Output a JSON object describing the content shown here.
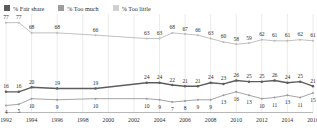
{
  "legend": {
    "items": [
      {
        "label": "% Fair share",
        "color": "#5b5b5b",
        "icon": "square-swatch"
      },
      {
        "label": "% Too much",
        "color": "#8f8f8f",
        "icon": "square-swatch"
      },
      {
        "label": "% Too little",
        "color": "#c4c4c4",
        "icon": "square-swatch"
      }
    ]
  },
  "chart_data": {
    "type": "line",
    "title": "",
    "subtitle": "",
    "xlabel": "",
    "ylabel": "",
    "grid": true,
    "grid_orientation": "vertical",
    "legend_position": "top-left",
    "ylim": [
      0,
      100
    ],
    "xlim": [
      1992,
      2016
    ],
    "x": [
      1992,
      1993,
      1994,
      1995,
      1996,
      1997,
      1998,
      1999,
      2000,
      2001,
      2002,
      2003,
      2004,
      2005,
      2006,
      2007,
      2008,
      2009,
      2010,
      2011,
      2012,
      2013,
      2014,
      2015,
      2016
    ],
    "tick_labels": [
      "1992",
      "1994",
      "1996",
      "1998",
      "2000",
      "2002",
      "2004",
      "2006",
      "2008",
      "2010",
      "2012",
      "2014",
      "2016"
    ],
    "tick_values": [
      1992,
      1994,
      1996,
      1998,
      2000,
      2002,
      2004,
      2006,
      2008,
      2010,
      2012,
      2014,
      2016
    ],
    "series": [
      {
        "name": "% Fair share",
        "color": "#b9b9b9",
        "x": [
          1992,
          1993,
          1994,
          1996,
          1999,
          2003,
          2004,
          2005,
          2006,
          2007,
          2008,
          2009,
          2010,
          2011,
          2012,
          2013,
          2014,
          2015,
          2016
        ],
        "values": [
          77,
          77,
          68,
          68,
          66,
          63,
          63,
          68,
          67,
          66,
          63,
          60,
          58,
          59,
          62,
          61,
          61,
          62,
          61
        ]
      },
      {
        "name": "% Too much",
        "color": "#5d5d5d",
        "x": [
          1992,
          1993,
          1994,
          1996,
          1999,
          2003,
          2004,
          2005,
          2006,
          2007,
          2008,
          2009,
          2010,
          2011,
          2012,
          2013,
          2014,
          2015,
          2016
        ],
        "values": [
          16,
          16,
          20,
          19,
          19,
          24,
          24,
          22,
          21,
          21,
          24,
          23,
          26,
          25,
          25,
          26,
          24,
          25,
          21
        ]
      },
      {
        "name": "% Too little",
        "color": "#9a9a9a",
        "x": [
          1992,
          1993,
          1994,
          1996,
          1999,
          2003,
          2004,
          2005,
          2006,
          2007,
          2008,
          2009,
          2010,
          2011,
          2012,
          2013,
          2014,
          2015,
          2016
        ],
        "values": [
          4,
          5,
          10,
          9,
          10,
          10,
          9,
          7,
          8,
          9,
          9,
          13,
          16,
          13,
          10,
          11,
          13,
          11,
          15
        ]
      }
    ]
  }
}
